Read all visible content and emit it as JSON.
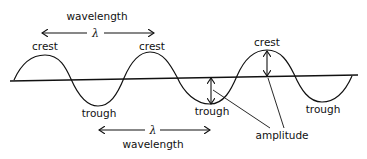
{
  "diagram": {
    "labels": {
      "wavelength_top": "wavelength",
      "lambda_top": "λ",
      "crest_1": "crest",
      "crest_2": "crest",
      "crest_3": "crest",
      "trough_1": "trough",
      "trough_2": "trough",
      "trough_3": "trough",
      "lambda_bottom": "λ",
      "wavelength_bottom": "wavelength",
      "amplitude": "amplitude"
    },
    "colors": {
      "line": "#111111",
      "background": "#ffffff"
    }
  }
}
